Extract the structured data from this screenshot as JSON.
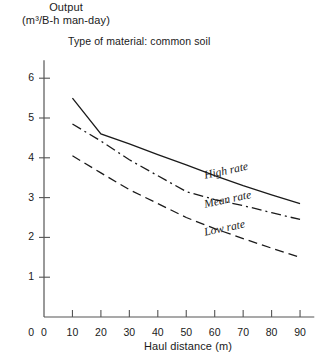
{
  "chart_data": {
    "type": "line",
    "title": "",
    "annotation": "Type of material: common soil",
    "ylabel_line1": "Output",
    "ylabel_line2": "(m³/B-h man-day)",
    "xlabel": "Haul distance (m)",
    "xlim": [
      0,
      95
    ],
    "ylim": [
      0,
      6.45
    ],
    "xticks": [
      0,
      10,
      20,
      30,
      40,
      50,
      60,
      70,
      80,
      90
    ],
    "yticks": [
      0,
      1,
      2,
      3,
      4,
      5,
      6
    ],
    "xtick_labels": [
      "0",
      "10",
      "20",
      "30",
      "40",
      "50",
      "60",
      "70",
      "80",
      "90"
    ],
    "ytick_labels": [
      "0",
      "1",
      "2",
      "3",
      "4",
      "5",
      "6"
    ],
    "grid": false,
    "legend": "inline-curve-labels",
    "x": [
      10,
      20,
      30,
      40,
      50,
      60,
      70,
      80,
      90
    ],
    "series": [
      {
        "name": "High rate",
        "style": "solid",
        "color": "#1a1a1a",
        "label_x": 56,
        "label_y": 3.72,
        "label_angle": -12,
        "values": [
          5.5,
          4.6,
          4.35,
          4.08,
          3.82,
          3.55,
          3.3,
          3.07,
          2.85
        ]
      },
      {
        "name": "Mean rate",
        "style": "dash-dot",
        "color": "#1a1a1a",
        "label_x": 56,
        "label_y": 3.0,
        "label_angle": -12,
        "values": [
          4.85,
          4.42,
          3.95,
          3.55,
          3.15,
          2.95,
          2.8,
          2.62,
          2.45
        ]
      },
      {
        "name": "Low rate",
        "style": "dashed",
        "color": "#1a1a1a",
        "label_x": 56,
        "label_y": 2.28,
        "label_angle": -12,
        "values": [
          4.05,
          3.62,
          3.2,
          2.85,
          2.5,
          2.22,
          1.97,
          1.73,
          1.5
        ]
      }
    ]
  },
  "axis": {
    "color": "#555555"
  }
}
